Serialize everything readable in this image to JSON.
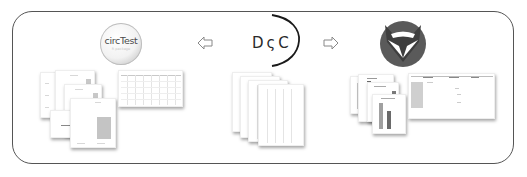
{
  "diagram": {
    "left_tool": {
      "logo_title": "circTest",
      "logo_subtitle": "R package",
      "logo_icon": "circtest-logo"
    },
    "center_tool": {
      "logo_text": "DςC",
      "logo_icon": "dcc-logo"
    },
    "right_tool": {
      "logo_icon": "fox-logo"
    },
    "arrows": [
      {
        "direction": "left",
        "icon": "arrow-left-outline-icon"
      },
      {
        "direction": "right",
        "icon": "arrow-right-outline-icon"
      }
    ],
    "outputs": {
      "left": [
        "plot-pages",
        "table-spreadsheet"
      ],
      "center": [
        "table-pages"
      ],
      "right": [
        "bar-chart-pages",
        "web-app-window"
      ]
    },
    "colors": {
      "frame": "#555555",
      "fox_dark": "#5a5a5a",
      "fox_light": "#ffffff",
      "text": "#2a2a2a"
    }
  }
}
